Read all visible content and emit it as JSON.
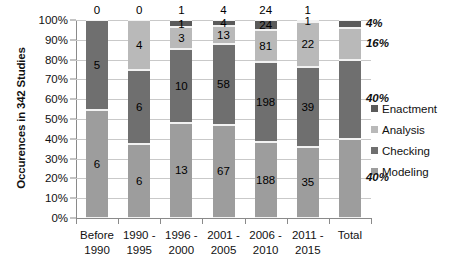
{
  "chart_data": {
    "type": "bar",
    "title": "",
    "subtitle": "",
    "xlabel": "",
    "ylabel": "Occurences in 342 Studies",
    "ylim": [
      0,
      100
    ],
    "y_unit": "percent",
    "stacked": true,
    "normalized": true,
    "grid": true,
    "legend_position": "right",
    "categories": [
      "Before 1990",
      "1990 - 1995",
      "1996 - 2000",
      "2001 - 2005",
      "2006 - 2010",
      "2011 - 2015",
      "Total"
    ],
    "category_lines": [
      [
        "Before",
        "1990"
      ],
      [
        "1990 -",
        "1995"
      ],
      [
        "1996 -",
        "2000"
      ],
      [
        "2001 -",
        "2005"
      ],
      [
        "2006 -",
        "2010"
      ],
      [
        "2011 -",
        "2015"
      ],
      [
        "Total",
        ""
      ]
    ],
    "ytick_labels": [
      "0%",
      "10%",
      "20%",
      "30%",
      "40%",
      "50%",
      "60%",
      "70%",
      "80%",
      "90%",
      "100%"
    ],
    "ytick_values": [
      0,
      10,
      20,
      30,
      40,
      50,
      60,
      70,
      80,
      90,
      100
    ],
    "series": [
      {
        "name": "Modeling",
        "color": "#9d9d9d",
        "values": [
          6,
          6,
          13,
          67,
          188,
          35,
          40
        ]
      },
      {
        "name": "Checking",
        "color": "#6f6f6f",
        "values": [
          5,
          6,
          10,
          58,
          198,
          39,
          40
        ]
      },
      {
        "name": "Analysis",
        "color": "#b9b9b9",
        "values": [
          0,
          4,
          3,
          13,
          81,
          22,
          16
        ]
      },
      {
        "name": "Enactment",
        "color": "#5a5a5a",
        "values": [
          0,
          0,
          1,
          4,
          24,
          1,
          4
        ]
      }
    ],
    "bar_labels": [
      {
        "category": "Before 1990",
        "modeling": "6",
        "checking": "5",
        "analysis": "0",
        "enactment": "0"
      },
      {
        "category": "1990 - 1995",
        "modeling": "6",
        "checking": "6",
        "analysis": "4",
        "enactment": "0"
      },
      {
        "category": "1996 - 2000",
        "modeling": "13",
        "checking": "10",
        "analysis": "3",
        "enactment": "1"
      },
      {
        "category": "2001 - 2005",
        "modeling": "67",
        "checking": "58",
        "analysis": "13",
        "enactment": "4"
      },
      {
        "category": "2006 - 2010",
        "modeling": "188",
        "checking": "198",
        "analysis": "81",
        "enactment": "24"
      },
      {
        "category": "2011 - 2015",
        "modeling": "35",
        "checking": "39",
        "analysis": "22",
        "enactment": "1"
      },
      {
        "category": "Total",
        "modeling": "40%",
        "checking": "40%",
        "analysis": "16%",
        "enactment": "4%"
      }
    ],
    "total_annotations": [
      {
        "label": "4%",
        "series": "Enactment"
      },
      {
        "label": "16%",
        "series": "Analysis"
      },
      {
        "label": "40%",
        "series": "Checking"
      },
      {
        "label": "40%",
        "series": "Modeling"
      }
    ],
    "legend": [
      {
        "label": "Enactment",
        "color": "#5a5a5a"
      },
      {
        "label": "Analysis",
        "color": "#b9b9b9"
      },
      {
        "label": "Checking",
        "color": "#6f6f6f"
      },
      {
        "label": "Modeling",
        "color": "#9d9d9d"
      }
    ]
  }
}
